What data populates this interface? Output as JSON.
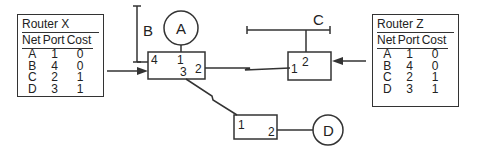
{
  "diagram": {
    "routers": [
      {
        "name": "Router X",
        "table": {
          "headers": [
            "Net",
            "Port",
            "Cost"
          ],
          "rows": [
            [
              "A",
              "1",
              "0"
            ],
            [
              "B",
              "4",
              "0"
            ],
            [
              "C",
              "2",
              "1"
            ],
            [
              "D",
              "3",
              "1"
            ]
          ]
        }
      },
      {
        "name": "Router Z",
        "table": {
          "headers": [
            "Net",
            "Port",
            "Cost"
          ],
          "rows": [
            [
              "A",
              "1",
              "0"
            ],
            [
              "B",
              "4",
              "0"
            ],
            [
              "C",
              "2",
              "1"
            ],
            [
              "D",
              "3",
              "1"
            ]
          ]
        }
      }
    ],
    "networks": {
      "a": "A",
      "b": "B",
      "c": "C",
      "d": "D"
    },
    "router_x_ports": {
      "p1": "1",
      "p2": "2",
      "p3": "3",
      "p4": "4"
    },
    "router_z_ports": {
      "p1": "1",
      "p2": "2"
    },
    "router_y_ports": {
      "p1": "1",
      "p2": "2"
    }
  }
}
